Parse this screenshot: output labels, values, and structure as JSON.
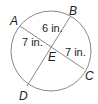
{
  "diagram": {
    "type": "circle-with-intersecting-chords",
    "points": {
      "A": {
        "label": "A"
      },
      "B": {
        "label": "B"
      },
      "C": {
        "label": "C"
      },
      "D": {
        "label": "D"
      },
      "E": {
        "label": "E"
      }
    },
    "chords": [
      {
        "name": "AC",
        "from": "A",
        "to": "C"
      },
      {
        "name": "BD",
        "from": "B",
        "to": "D"
      }
    ],
    "segment_labels": {
      "AE": "7 in.",
      "EC": "7 in.",
      "BE": "6 in."
    },
    "colors": {
      "line": "#8a8a8a",
      "text": "#222222"
    }
  }
}
